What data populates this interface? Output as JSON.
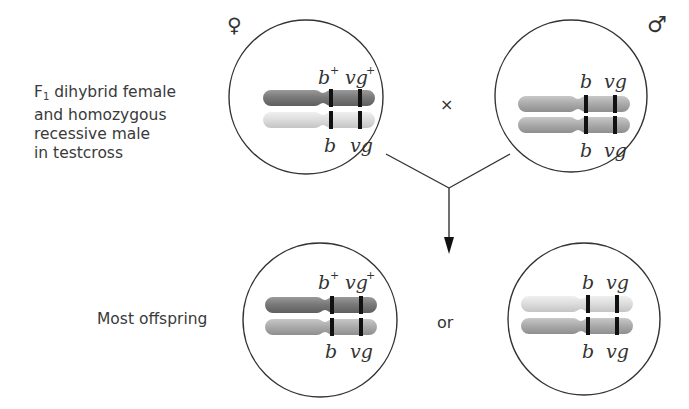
{
  "labels": {
    "testcross_line1_prefix": "F",
    "testcross_line1_sub": "1",
    "testcross_line1_rest": " dihybrid female",
    "testcross_line2": "and homozygous",
    "testcross_line3": "recessive male",
    "testcross_line4": "in testcross",
    "offspring": "Most offspring",
    "cross_symbol": "×",
    "or": "or",
    "female_symbol": "♀",
    "male_symbol": "♂"
  },
  "cells": [
    {
      "id": "female-parent",
      "top_alleles": [
        "b",
        "vg"
      ],
      "top_sup": [
        "+",
        "+"
      ],
      "bottom_alleles": [
        "b",
        "vg"
      ],
      "top_color": "#7a7a7a",
      "bottom_color": "#dcdcdc"
    },
    {
      "id": "male-parent",
      "top_alleles": [
        "b",
        "vg"
      ],
      "top_sup": [
        "",
        ""
      ],
      "bottom_alleles": [
        "b",
        "vg"
      ],
      "top_color": "#a8a8a8",
      "bottom_color": "#a8a8a8"
    },
    {
      "id": "offspring-wildtype",
      "top_alleles": [
        "b",
        "vg"
      ],
      "top_sup": [
        "+",
        "+"
      ],
      "bottom_alleles": [
        "b",
        "vg"
      ],
      "top_color": "#7a7a7a",
      "bottom_color": "#a8a8a8"
    },
    {
      "id": "offspring-mutant",
      "top_alleles": [
        "b",
        "vg"
      ],
      "top_sup": [
        "",
        ""
      ],
      "bottom_alleles": [
        "b",
        "vg"
      ],
      "top_color": "#dcdcdc",
      "bottom_color": "#a8a8a8"
    }
  ]
}
